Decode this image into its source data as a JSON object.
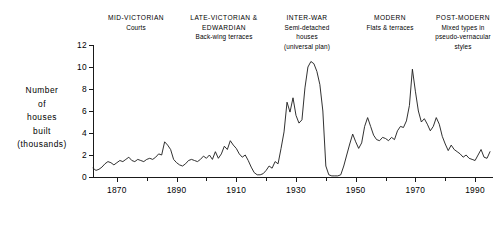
{
  "chart_data": {
    "type": "line",
    "title": "",
    "xlabel": "",
    "ylabel": "Number of houses built (thousands)",
    "xlim": [
      1862,
      1996
    ],
    "ylim": [
      0,
      12
    ],
    "grid": false,
    "legend": false,
    "y_ticks": [
      0,
      2,
      4,
      6,
      8,
      10,
      12
    ],
    "y_tick_labels": [
      "0",
      "2",
      "4",
      "6",
      "8",
      "10",
      "12"
    ],
    "x_ticks": [
      1870,
      1890,
      1910,
      1930,
      1950,
      1970,
      1990
    ],
    "x_tick_labels": [
      "1870",
      "1890",
      "1910",
      "1930",
      "1950",
      "1970",
      "1990"
    ],
    "x_minor_ticks": [
      1880,
      1900,
      1920,
      1940,
      1960,
      1980
    ],
    "line_color": "#1a1a1a",
    "x": [
      1862,
      1863,
      1864,
      1865,
      1866,
      1867,
      1868,
      1869,
      1870,
      1871,
      1872,
      1873,
      1874,
      1875,
      1876,
      1877,
      1878,
      1879,
      1880,
      1881,
      1882,
      1883,
      1884,
      1885,
      1886,
      1887,
      1888,
      1889,
      1890,
      1891,
      1892,
      1893,
      1894,
      1895,
      1896,
      1897,
      1898,
      1899,
      1900,
      1901,
      1902,
      1903,
      1904,
      1905,
      1906,
      1907,
      1908,
      1909,
      1910,
      1911,
      1912,
      1913,
      1914,
      1915,
      1916,
      1917,
      1918,
      1919,
      1920,
      1921,
      1922,
      1923,
      1924,
      1925,
      1926,
      1927,
      1928,
      1929,
      1930,
      1931,
      1932,
      1933,
      1934,
      1935,
      1936,
      1937,
      1938,
      1939,
      1940,
      1941,
      1942,
      1943,
      1944,
      1945,
      1946,
      1947,
      1948,
      1949,
      1950,
      1951,
      1952,
      1953,
      1954,
      1955,
      1956,
      1957,
      1958,
      1959,
      1960,
      1961,
      1962,
      1963,
      1964,
      1965,
      1966,
      1967,
      1968,
      1969,
      1970,
      1971,
      1972,
      1973,
      1974,
      1975,
      1976,
      1977,
      1978,
      1979,
      1980,
      1981,
      1982,
      1983,
      1984,
      1985,
      1986,
      1987,
      1988,
      1989,
      1990,
      1991,
      1992,
      1993,
      1994,
      1995
    ],
    "y": [
      0.8,
      0.6,
      0.7,
      0.9,
      1.2,
      1.4,
      1.3,
      1.1,
      1.3,
      1.5,
      1.4,
      1.6,
      1.8,
      1.5,
      1.4,
      1.6,
      1.5,
      1.4,
      1.6,
      1.7,
      1.6,
      1.8,
      2.1,
      2.0,
      3.2,
      2.9,
      2.5,
      1.6,
      1.3,
      1.1,
      1.0,
      1.2,
      1.5,
      1.6,
      1.5,
      1.4,
      1.6,
      1.9,
      1.7,
      2.0,
      1.6,
      2.3,
      1.7,
      2.1,
      2.8,
      2.5,
      3.3,
      2.9,
      2.6,
      2.1,
      1.8,
      2.0,
      1.5,
      0.9,
      0.4,
      0.2,
      0.2,
      0.3,
      0.6,
      1.0,
      0.8,
      1.4,
      1.2,
      2.6,
      4.1,
      6.8,
      5.9,
      7.2,
      5.6,
      4.9,
      5.2,
      8.1,
      10.0,
      10.5,
      10.3,
      9.6,
      8.4,
      6.0,
      1.0,
      0.2,
      0.1,
      0.1,
      0.1,
      0.2,
      1.0,
      2.0,
      3.0,
      3.9,
      3.2,
      2.6,
      3.1,
      4.6,
      5.4,
      4.6,
      3.8,
      3.4,
      3.3,
      3.6,
      3.5,
      3.3,
      3.6,
      3.4,
      4.2,
      4.6,
      4.5,
      5.1,
      6.5,
      9.8,
      7.8,
      6.0,
      5.0,
      5.3,
      4.8,
      4.2,
      4.6,
      5.4,
      4.8,
      3.7,
      3.0,
      2.4,
      2.9,
      2.5,
      2.3,
      2.1,
      1.8,
      2.0,
      1.7,
      1.6,
      1.5,
      2.0,
      2.5,
      1.8,
      1.7,
      2.3
    ]
  },
  "period_labels": [
    {
      "era": "MID-VICTORIAN",
      "desc": [
        "Courts"
      ]
    },
    {
      "era": "LATE-VICTORIAN &",
      "desc": [
        "EDWARDIAN",
        "Back-wing terraces"
      ]
    },
    {
      "era": "INTER-WAR",
      "desc": [
        "Semi-detached",
        "houses",
        "(universal plan)"
      ]
    },
    {
      "era": "MODERN",
      "desc": [
        "Flats & terraces"
      ]
    },
    {
      "era": "POST-MODERN",
      "desc": [
        "Mixed types in",
        "pseudo-vernacular",
        "styles"
      ]
    }
  ],
  "axis_title_lines": [
    "Number",
    "of",
    "houses",
    "built",
    "(thousands)"
  ]
}
